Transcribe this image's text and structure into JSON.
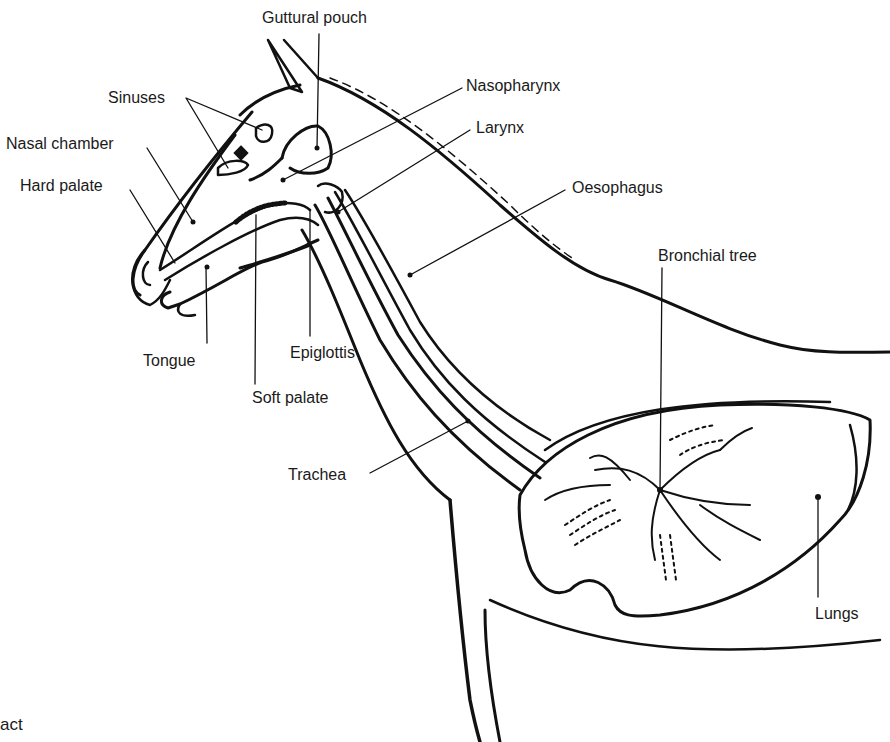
{
  "diagram": {
    "caption_fragment": "act",
    "labels": [
      {
        "id": "guttural-pouch",
        "text": "Guttural pouch"
      },
      {
        "id": "sinuses",
        "text": "Sinuses"
      },
      {
        "id": "nasopharynx",
        "text": "Nasopharynx"
      },
      {
        "id": "nasal-chamber",
        "text": "Nasal chamber"
      },
      {
        "id": "larynx",
        "text": "Larynx"
      },
      {
        "id": "hard-palate",
        "text": "Hard palate"
      },
      {
        "id": "oesophagus",
        "text": "Oesophagus"
      },
      {
        "id": "bronchial-tree",
        "text": "Bronchial tree"
      },
      {
        "id": "tongue",
        "text": "Tongue"
      },
      {
        "id": "epiglottis",
        "text": "Epiglottis"
      },
      {
        "id": "soft-palate",
        "text": "Soft palate"
      },
      {
        "id": "trachea",
        "text": "Trachea"
      },
      {
        "id": "lungs",
        "text": "Lungs"
      }
    ],
    "colors": {
      "ink": "#111111",
      "background": "#ffffff"
    }
  }
}
